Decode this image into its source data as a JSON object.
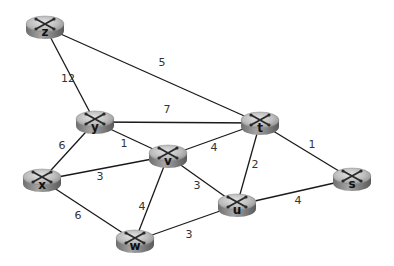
{
  "diagram": {
    "type": "network-graph",
    "nodes": [
      {
        "id": "z",
        "label": "z",
        "x": 45,
        "y": 27
      },
      {
        "id": "y",
        "label": "y",
        "x": 95,
        "y": 122
      },
      {
        "id": "t",
        "label": "t",
        "x": 260,
        "y": 123
      },
      {
        "id": "v",
        "label": "v",
        "x": 168,
        "y": 156
      },
      {
        "id": "x",
        "label": "x",
        "x": 42,
        "y": 180
      },
      {
        "id": "s",
        "label": "s",
        "x": 352,
        "y": 179
      },
      {
        "id": "u",
        "label": "u",
        "x": 237,
        "y": 205
      },
      {
        "id": "w",
        "label": "w",
        "x": 135,
        "y": 241
      }
    ],
    "edges": [
      {
        "from": "z",
        "to": "y",
        "weight": "12",
        "lx": 68,
        "ly": 82
      },
      {
        "from": "z",
        "to": "t",
        "weight": "5",
        "lx": 162,
        "ly": 66
      },
      {
        "from": "y",
        "to": "t",
        "weight": "7",
        "lx": 167,
        "ly": 113
      },
      {
        "from": "y",
        "to": "v",
        "weight": "1",
        "lx": 124,
        "ly": 147
      },
      {
        "from": "y",
        "to": "x",
        "weight": "6",
        "lx": 62,
        "ly": 149
      },
      {
        "from": "v",
        "to": "t",
        "weight": "4",
        "lx": 214,
        "ly": 151
      },
      {
        "from": "x",
        "to": "v",
        "weight": "3",
        "lx": 100,
        "ly": 180
      },
      {
        "from": "v",
        "to": "u",
        "weight": "3",
        "lx": 197,
        "ly": 189
      },
      {
        "from": "v",
        "to": "w",
        "weight": "4",
        "lx": 142,
        "ly": 210
      },
      {
        "from": "t",
        "to": "u",
        "weight": "2",
        "lx": 255,
        "ly": 168
      },
      {
        "from": "t",
        "to": "s",
        "weight": "1",
        "lx": 312,
        "ly": 148
      },
      {
        "from": "x",
        "to": "w",
        "weight": "6",
        "lx": 78,
        "ly": 219
      },
      {
        "from": "w",
        "to": "u",
        "weight": "3",
        "lx": 189,
        "ly": 238
      },
      {
        "from": "u",
        "to": "s",
        "weight": "4",
        "lx": 298,
        "ly": 204
      }
    ],
    "colors": {
      "edge": "#1a1a1a",
      "router_top": "#c8c8c8",
      "router_side": "#7a7a7a",
      "router_mark": "#2a2a2a",
      "label": "#333333"
    }
  }
}
